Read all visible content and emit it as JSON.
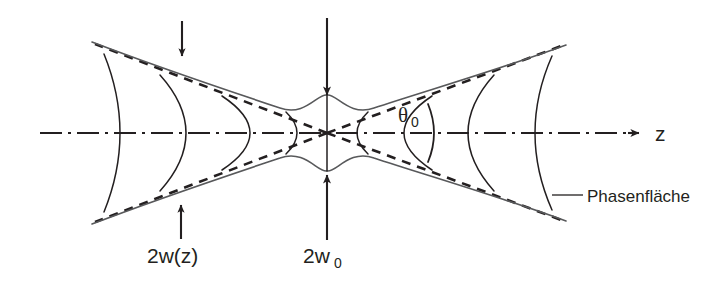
{
  "figure": {
    "kind": "gaussian-beam-propagation-diagram",
    "language": "de",
    "background_color": "#ffffff",
    "line_color": "#231f20",
    "envelope_color": "#58595b"
  },
  "labels": {
    "axis_z": "z",
    "divergence_angle": "θ",
    "divergence_angle_subscript": "0",
    "beam_diameter_z": "2w(z)",
    "beam_waist_prefix": "2w",
    "beam_waist_subscript": "0",
    "phase_front": "Phasenfläche"
  },
  "geometry": {
    "axis_y": 133,
    "waist_x": 327,
    "waist_half_width": 38,
    "left_end_x": 92,
    "right_end_x": 566,
    "left_end_half_width": 91,
    "right_end_half_width": 88
  },
  "annotations": {
    "arrow_down_left_x": 182,
    "arrow_down_center_x": 327,
    "arrow_up_left_x": 181,
    "arrow_up_center_x": 327,
    "theta_label_x": 400,
    "theta_label_y": 120,
    "phase_front_label_x": 588,
    "phase_front_label_y": 196,
    "z_label_x": 655,
    "z_label_y": 141
  },
  "phase_fronts": {
    "axis_crossings_left": [
      145,
      205,
      267
    ],
    "axis_crossings_right": [
      385,
      445,
      505,
      562
    ],
    "count": 9
  }
}
